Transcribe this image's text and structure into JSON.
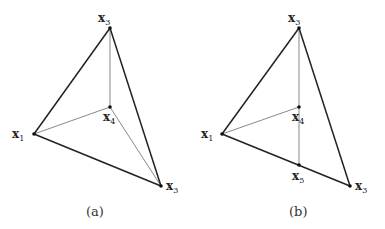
{
  "figures": [
    {
      "caption": "(a)",
      "vertices": [
        {
          "id": "top",
          "label": "x",
          "sub": "3",
          "x": 110,
          "y": 28
        },
        {
          "id": "left",
          "label": "x",
          "sub": "1",
          "x": 34,
          "y": 134
        },
        {
          "id": "inner",
          "label": "x",
          "sub": "4",
          "x": 110,
          "y": 107
        },
        {
          "id": "right",
          "label": "x",
          "sub": "3",
          "x": 161,
          "y": 186
        }
      ]
    },
    {
      "caption": "(b)",
      "vertices": [
        {
          "id": "top",
          "label": "x",
          "sub": "3",
          "x": 299,
          "y": 28
        },
        {
          "id": "left",
          "label": "x",
          "sub": "1",
          "x": 222,
          "y": 134
        },
        {
          "id": "inner",
          "label": "x",
          "sub": "4",
          "x": 299,
          "y": 107
        },
        {
          "id": "edge",
          "label": "x",
          "sub": "5",
          "x": 299,
          "y": 165
        },
        {
          "id": "right",
          "label": "x",
          "sub": "3",
          "x": 350,
          "y": 186
        }
      ]
    }
  ]
}
